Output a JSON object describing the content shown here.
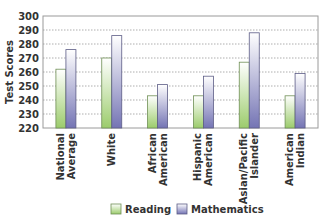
{
  "chart_data": {
    "type": "bar",
    "title": "",
    "xlabel": "",
    "ylabel": "Test Scores",
    "ylim": [
      220,
      300
    ],
    "yticks": [
      220,
      230,
      240,
      250,
      260,
      270,
      280,
      290,
      300
    ],
    "grid": true,
    "legend_position": "bottom",
    "categories": [
      [
        "National",
        "Average"
      ],
      [
        "White"
      ],
      [
        "African",
        "American"
      ],
      [
        "Hispanic",
        "American"
      ],
      [
        "Asian/Pacific",
        "Islander"
      ],
      [
        "American",
        "Indian"
      ]
    ],
    "series": [
      {
        "name": "Reading",
        "color": "#a8d67f",
        "values": [
          262,
          270,
          243,
          243,
          267,
          243
        ]
      },
      {
        "name": "Mathematics",
        "color": "#8888c0",
        "values": [
          276,
          286,
          251,
          257,
          288,
          259
        ]
      }
    ]
  }
}
